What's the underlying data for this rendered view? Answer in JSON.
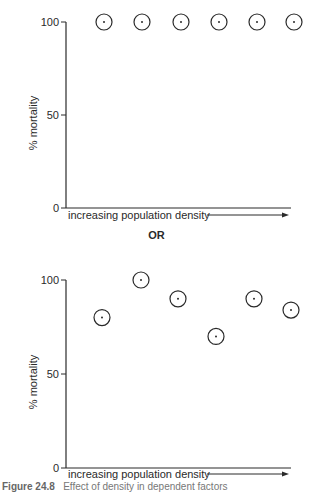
{
  "separator_label": "OR",
  "caption": {
    "figure_number": "Figure 24.8",
    "text": "Effect of density in dependent factors"
  },
  "chart_data": [
    {
      "type": "scatter",
      "title": "",
      "xlabel": "increasing population density",
      "ylabel": "% mortality",
      "ylim": [
        0,
        100
      ],
      "yticks": [
        0,
        50,
        100
      ],
      "grid": false,
      "legend": null,
      "x_arrow": true,
      "marker": "circle-with-center-dot",
      "x": [
        1,
        2,
        3,
        4,
        5,
        6
      ],
      "values": [
        100,
        100,
        100,
        100,
        100,
        100
      ]
    },
    {
      "type": "scatter",
      "title": "",
      "xlabel": "increasing population density",
      "ylabel": "% mortality",
      "ylim": [
        0,
        100
      ],
      "yticks": [
        0,
        50,
        100
      ],
      "grid": false,
      "legend": null,
      "x_arrow": true,
      "marker": "circle-with-center-dot",
      "x": [
        1,
        2,
        3,
        4,
        5,
        6
      ],
      "values": [
        80,
        100,
        90,
        70,
        90,
        84
      ]
    }
  ]
}
